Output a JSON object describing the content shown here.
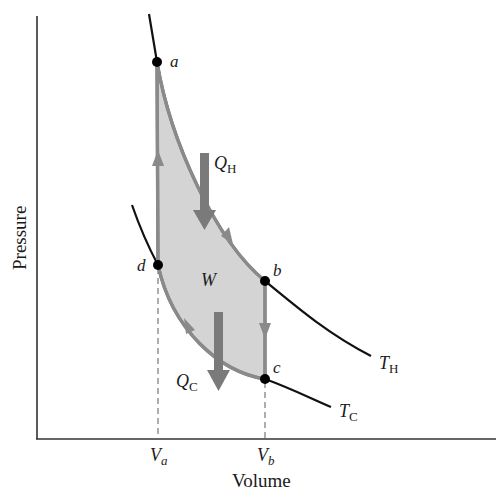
{
  "diagram": {
    "type": "PV diagram (Carnot cycle)",
    "axes": {
      "x_label": "Volume",
      "y_label": "Pressure",
      "x_ticks": [
        {
          "main": "V",
          "sub": "a"
        },
        {
          "main": "V",
          "sub": "b"
        }
      ]
    },
    "points": [
      {
        "id": "a",
        "label": "a"
      },
      {
        "id": "b",
        "label": "b"
      },
      {
        "id": "c",
        "label": "c"
      },
      {
        "id": "d",
        "label": "d"
      }
    ],
    "isotherms": [
      {
        "id": "hot",
        "main": "T",
        "sub": "H"
      },
      {
        "id": "cold",
        "main": "T",
        "sub": "C"
      }
    ],
    "heat_labels": {
      "hot": {
        "main": "Q",
        "sub": "H"
      },
      "cold": {
        "main": "Q",
        "sub": "C"
      }
    },
    "work_label": "W",
    "colors": {
      "curve": "#111111",
      "cycle_fill": "#d4d4d4",
      "cycle_stroke": "#8a8a8a",
      "heat_arrow": "#7a7a7a",
      "axis": "#333333"
    }
  }
}
